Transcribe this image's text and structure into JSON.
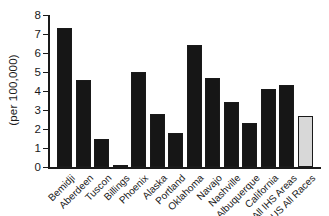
{
  "chart_data": {
    "type": "bar",
    "title": "",
    "ylabel": "(per 100,000)",
    "xlabel": "",
    "ylim": [
      0,
      8
    ],
    "yticks": [
      0,
      1,
      2,
      3,
      4,
      5,
      6,
      7,
      8
    ],
    "grid": false,
    "legend": "none",
    "categories": [
      "Bemidji",
      "Aberdeen",
      "Tuscon",
      "Billings",
      "Phoenix",
      "Alaska",
      "Portland",
      "Oklahoma",
      "Navajo",
      "Nashville",
      "Albuquerque",
      "California",
      "All IHS Areas",
      "US All Races"
    ],
    "values": [
      7.3,
      4.6,
      1.5,
      0.1,
      5.0,
      2.8,
      1.8,
      6.4,
      4.7,
      3.4,
      2.3,
      4.1,
      4.3,
      2.7
    ],
    "bar_colors": [
      "#161616",
      "#161616",
      "#161616",
      "#161616",
      "#161616",
      "#161616",
      "#161616",
      "#161616",
      "#161616",
      "#161616",
      "#161616",
      "#161616",
      "#161616",
      "#d8d8d8"
    ],
    "bar_border_color": "#1a1a1a",
    "axis_color": "#1a1a1a",
    "background_color": "#ffffff"
  }
}
